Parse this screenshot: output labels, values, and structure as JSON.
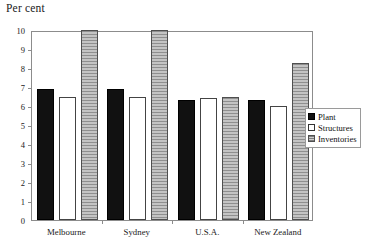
{
  "chart_data": {
    "type": "bar",
    "title": "Per cent",
    "ylabel": "Per cent",
    "xlabel": "",
    "ylim": [
      0,
      10
    ],
    "yticks": [
      0,
      1,
      2,
      3,
      4,
      5,
      6,
      7,
      8,
      9,
      10
    ],
    "ytick_labels": [
      "0",
      "1",
      "2",
      "3",
      "4",
      "5",
      "6",
      "7",
      "8",
      "9",
      "10"
    ],
    "grid": false,
    "legend_position": "right",
    "categories": [
      "Melbourne",
      "Sydney",
      "U.S.A.",
      "New Zealand"
    ],
    "series": [
      {
        "name": "Plant",
        "color": "#111111",
        "values": [
          6.9,
          6.9,
          6.3,
          6.3
        ]
      },
      {
        "name": "Structures",
        "color": "#ffffff",
        "values": [
          6.45,
          6.45,
          6.4,
          6.0
        ]
      },
      {
        "name": "Inventories",
        "color": "#a8a8a8",
        "values": [
          10.0,
          10.0,
          6.5,
          8.25
        ]
      }
    ]
  },
  "legend": {
    "items": [
      {
        "label": "Plant"
      },
      {
        "label": "Structures"
      },
      {
        "label": "Inventories"
      }
    ]
  },
  "colors": {
    "plant": "#111111",
    "structures": "#ffffff",
    "inventories": "#a8a8a8",
    "axis": "#8c8c8c",
    "text": "#1a1a1a"
  }
}
